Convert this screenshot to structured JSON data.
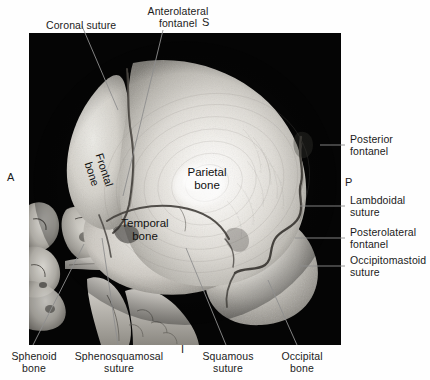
{
  "figure": {
    "kind": "3d-ct-reconstruction",
    "panel": {
      "background": "#050505",
      "x": 29,
      "y": 33,
      "w": 312,
      "h": 312
    }
  },
  "orientation_markers": [
    {
      "id": "superior",
      "letter": "S",
      "x": 202,
      "y": 17
    },
    {
      "id": "anterior",
      "letter": "A",
      "x": 7,
      "y": 172
    },
    {
      "id": "posterior",
      "letter": "P",
      "x": 345,
      "y": 177
    },
    {
      "id": "inferior",
      "letter": "I",
      "x": 181,
      "y": 344
    }
  ],
  "labels": {
    "coronal_suture": {
      "text": "Coronal suture",
      "lines": [
        "Coronal suture"
      ]
    },
    "anterolateral_fontanel": {
      "text": "Anterolateral fontanel",
      "lines": [
        "Anterolateral",
        "fontanel"
      ]
    },
    "posterior_fontanel": {
      "text": "Posterior fontanel",
      "lines": [
        "Posterior",
        "fontanel"
      ]
    },
    "lambdoidal_suture": {
      "text": "Lambdoidal suture",
      "lines": [
        "Lambdoidal",
        "suture"
      ]
    },
    "posterolateral_fontanel": {
      "text": "Posterolateral fontanel",
      "lines": [
        "Posterolateral",
        "fontanel"
      ]
    },
    "occipitomastoid_suture": {
      "text": "Occipitomastoid suture",
      "lines": [
        "Occipitomastoid",
        "suture"
      ]
    },
    "sphenoid_bone": {
      "text": "Sphenoid bone",
      "lines": [
        "Sphenoid",
        "bone"
      ]
    },
    "sphenosquamosal_suture": {
      "text": "Sphenosquamosal suture",
      "lines": [
        "Sphenosquamosal",
        "suture"
      ]
    },
    "squamous_suture": {
      "text": "Squamous suture",
      "lines": [
        "Squamous",
        "suture"
      ]
    },
    "occipital_bone": {
      "text": "Occipital bone",
      "lines": [
        "Occipital",
        "bone"
      ]
    },
    "parietal_bone": {
      "text": "Parietal bone",
      "lines": [
        "Parietal",
        "bone"
      ]
    },
    "temporal_bone": {
      "text": "Temporal bone",
      "lines": [
        "Temporal",
        "bone"
      ]
    },
    "frontal_bone": {
      "text": "Frontal bone",
      "lines": [
        "Frontal",
        "bone"
      ]
    }
  },
  "colors": {
    "text": "#1b1b1b",
    "leader_line": "#9a9a9a",
    "panel_background": "#050505",
    "bone_light": "#f2f0ec",
    "bone_mid": "#c9c6c0",
    "bone_dark": "#8d8a84",
    "suture_line": "#4a4743",
    "page_background": "#ffffff"
  }
}
